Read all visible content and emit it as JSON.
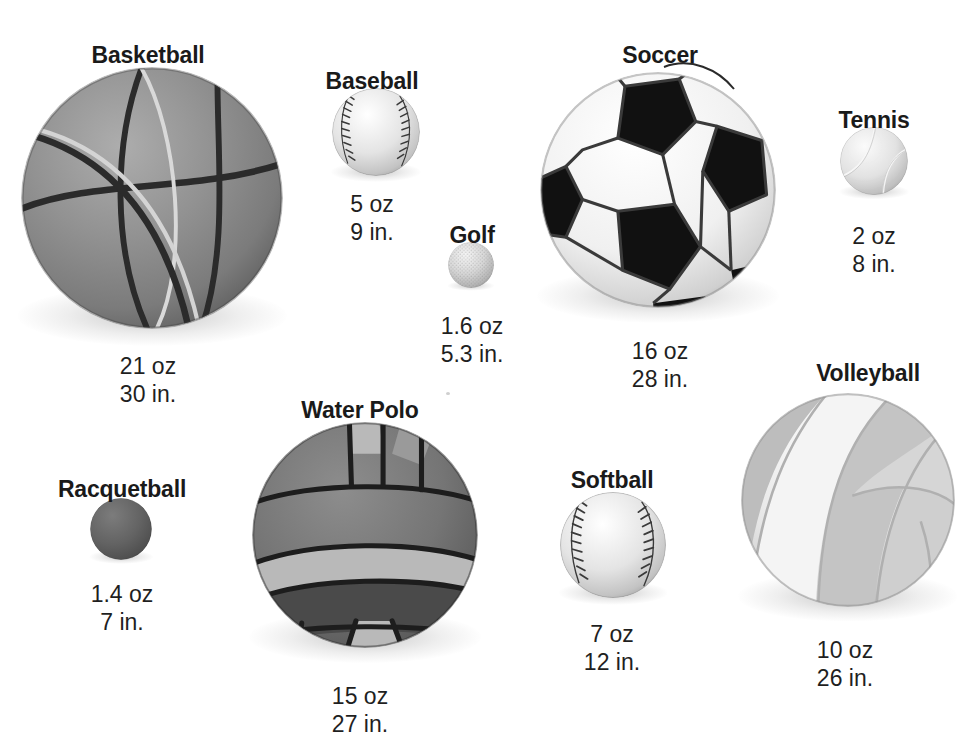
{
  "figure": {
    "background_color": "#ffffff",
    "text_color": "#1a1a1a"
  },
  "balls": [
    {
      "name": "Basketball",
      "weight": "21 oz",
      "circumference": "30 in.",
      "label_x": 148,
      "label_y": 42,
      "stats_x": 148,
      "stats_y": 352,
      "cx": 152,
      "cy": 198,
      "r": 131,
      "color": "#8b8b8b",
      "type": "basketball"
    },
    {
      "name": "Baseball",
      "weight": "5 oz",
      "circumference": "9 in.",
      "label_x": 372,
      "label_y": 68,
      "stats_x": 372,
      "stats_y": 190,
      "cx": 376,
      "cy": 132,
      "r": 44,
      "color": "#dcdcdc",
      "type": "baseball"
    },
    {
      "name": "Golf",
      "weight": "1.6 oz",
      "circumference": "5.3 in.",
      "label_x": 472,
      "label_y": 222,
      "stats_x": 472,
      "stats_y": 312,
      "cx": 471,
      "cy": 265,
      "r": 23,
      "color": "#cfcfcf",
      "type": "golf"
    },
    {
      "name": "Soccer",
      "weight": "16 oz",
      "circumference": "28 in.",
      "label_x": 660,
      "label_y": 42,
      "stats_x": 660,
      "stats_y": 337,
      "cx": 658,
      "cy": 190,
      "r": 118,
      "color": "#f2f2f2",
      "type": "soccer"
    },
    {
      "name": "Tennis",
      "weight": "2 oz",
      "circumference": "8 in.",
      "label_x": 874,
      "label_y": 107,
      "stats_x": 874,
      "stats_y": 222,
      "cx": 874,
      "cy": 161,
      "r": 34,
      "color": "#e3e3e3",
      "type": "tennis"
    },
    {
      "name": "Water Polo",
      "weight": "15 oz",
      "circumference": "27 in.",
      "label_x": 360,
      "label_y": 397,
      "stats_x": 360,
      "stats_y": 682,
      "cx": 365,
      "cy": 535,
      "r": 113,
      "color": "#6e6e6e",
      "type": "waterpolo"
    },
    {
      "name": "Racquetball",
      "weight": "1.4 oz",
      "circumference": "7 in.",
      "label_x": 122,
      "label_y": 476,
      "stats_x": 122,
      "stats_y": 580,
      "cx": 121,
      "cy": 529,
      "r": 31,
      "color": "#5d5d5d",
      "type": "racquetball"
    },
    {
      "name": "Softball",
      "weight": "7 oz",
      "circumference": "12 in.",
      "label_x": 612,
      "label_y": 467,
      "stats_x": 612,
      "stats_y": 620,
      "cx": 613,
      "cy": 545,
      "r": 53,
      "color": "#dddddd",
      "type": "softball"
    },
    {
      "name": "Volleyball",
      "weight": "10 oz",
      "circumference": "26 in.",
      "label_x": 868,
      "label_y": 360,
      "stats_x": 845,
      "stats_y": 636,
      "cx": 848,
      "cy": 500,
      "r": 107,
      "color": "#dcdcdc",
      "type": "volleyball"
    }
  ]
}
